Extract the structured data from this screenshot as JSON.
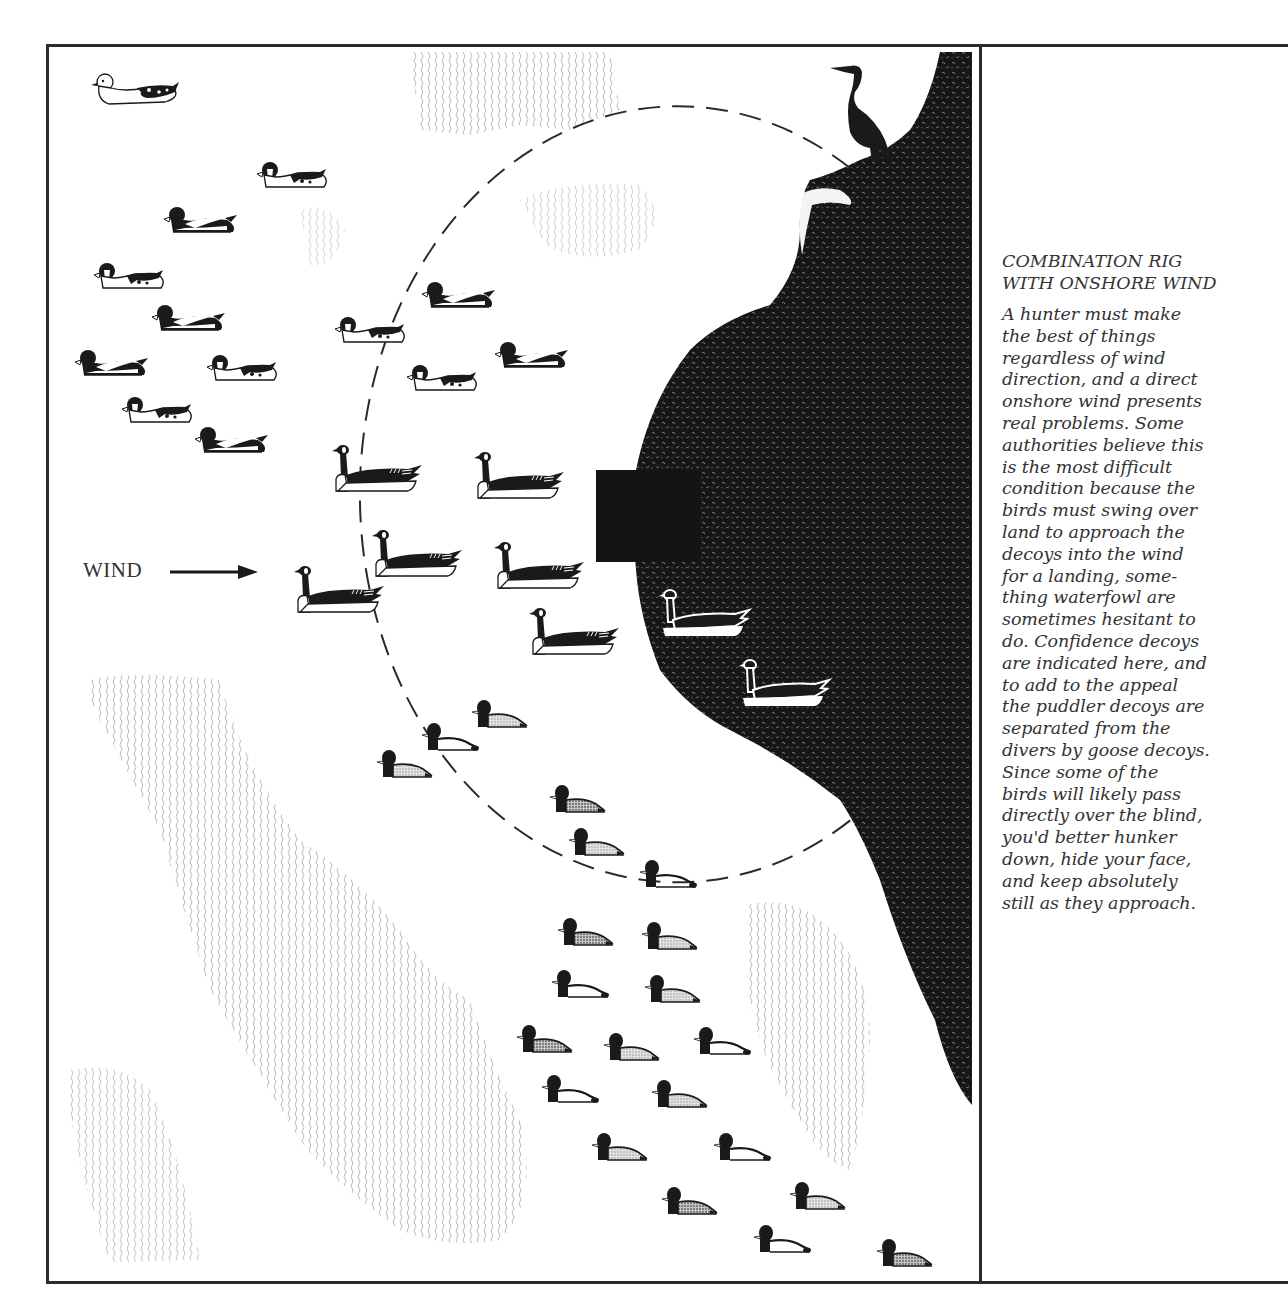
{
  "figure": {
    "title": "COMBINATION RIG\nWITH ONSHORE WIND",
    "caption": "A hunter must make\nthe best of things\nregardless of wind\ndirection, and a direct\nonshore wind presents\nreal problems. Some\nauthorities believe this\nis the most difficult\ncondition because the\nbirds must swing over\nland to approach the\ndecoys into the wind\nfor a landing, some-\nthing waterfowl are\nsometimes hesitant to\ndo. Confidence decoys\nare indicated here, and\nto add to the appeal\nthe puddler decoys are\nseparated from the\ndivers by goose decoys.\nSince some of the\nbirds will likely pass\ndirectly over the blind,\nyou'd better hunker\ndown, hide your face,\nand keep absolutely\nstill as they approach."
  },
  "diagram": {
    "wind_label": "WIND",
    "wind_direction": "east (onshore)",
    "colors": {
      "ink": "#1a1a1a",
      "water_texture": "#b5b5b5",
      "shading": "#c8c8c8",
      "paper": "#ffffff"
    },
    "elements": {
      "gull_confidence_decoy": {
        "count": 1,
        "x": 135,
        "y": 88
      },
      "heron_confidence_decoy": {
        "count": 1,
        "x": 860,
        "y": 110
      },
      "mallard_decoys": [
        {
          "x": 290,
          "y": 175
        },
        {
          "x": 197,
          "y": 220
        },
        {
          "x": 127,
          "y": 276
        },
        {
          "x": 185,
          "y": 318
        },
        {
          "x": 108,
          "y": 363
        },
        {
          "x": 240,
          "y": 368
        },
        {
          "x": 155,
          "y": 410
        },
        {
          "x": 228,
          "y": 440
        },
        {
          "x": 455,
          "y": 295
        },
        {
          "x": 368,
          "y": 330
        },
        {
          "x": 528,
          "y": 355
        },
        {
          "x": 440,
          "y": 378
        }
      ],
      "canada_goose_decoys": [
        {
          "x": 378,
          "y": 465
        },
        {
          "x": 520,
          "y": 475
        },
        {
          "x": 418,
          "y": 552
        },
        {
          "x": 540,
          "y": 565
        },
        {
          "x": 340,
          "y": 588
        },
        {
          "x": 575,
          "y": 630
        }
      ],
      "canada_goose_confidence_on_shore": [
        {
          "x": 705,
          "y": 612
        },
        {
          "x": 785,
          "y": 680
        }
      ],
      "diver_decoys": [
        {
          "x": 500,
          "y": 715
        },
        {
          "x": 450,
          "y": 738
        },
        {
          "x": 405,
          "y": 765
        },
        {
          "x": 578,
          "y": 800
        },
        {
          "x": 597,
          "y": 843
        },
        {
          "x": 668,
          "y": 875
        },
        {
          "x": 586,
          "y": 933
        },
        {
          "x": 670,
          "y": 937
        },
        {
          "x": 580,
          "y": 985
        },
        {
          "x": 673,
          "y": 990
        },
        {
          "x": 545,
          "y": 1040
        },
        {
          "x": 632,
          "y": 1048
        },
        {
          "x": 722,
          "y": 1042
        },
        {
          "x": 570,
          "y": 1090
        },
        {
          "x": 680,
          "y": 1095
        },
        {
          "x": 620,
          "y": 1148
        },
        {
          "x": 742,
          "y": 1148
        },
        {
          "x": 690,
          "y": 1202
        },
        {
          "x": 818,
          "y": 1197
        },
        {
          "x": 782,
          "y": 1240
        },
        {
          "x": 905,
          "y": 1254
        }
      ],
      "blind": {
        "x": 596,
        "y": 470,
        "width": 104,
        "height": 92
      },
      "shooting_range_circle": {
        "style": "dashed"
      }
    }
  }
}
